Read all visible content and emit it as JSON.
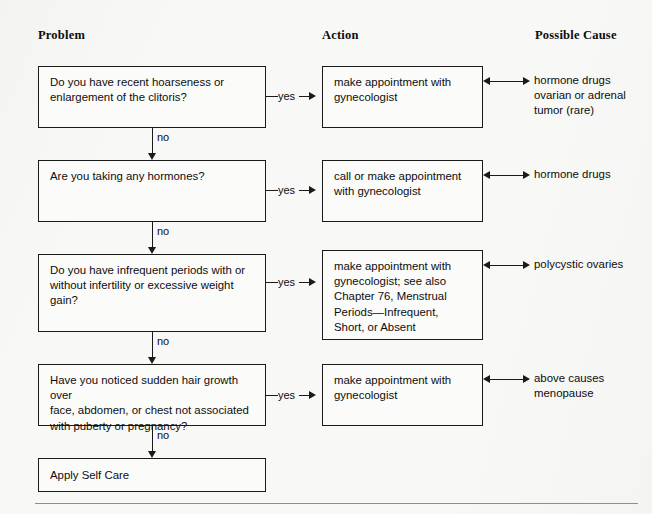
{
  "headers": {
    "problem": "Problem",
    "action": "Action",
    "cause": "Possible Cause"
  },
  "edge_labels": {
    "yes": "yes",
    "no": "no"
  },
  "rows": [
    {
      "problem": "Do you have recent hoarseness or\nenlargement of the clitoris?",
      "action": "make appointment with\ngynecologist",
      "cause": "hormone drugs\novarian or adrenal\ntumor (rare)",
      "yes": "yes",
      "no": "no"
    },
    {
      "problem": "Are you taking any hormones?",
      "action": "call or make appointment\nwith gynecologist",
      "cause": "hormone drugs",
      "yes": "yes",
      "no": "no"
    },
    {
      "problem": "Do you have infrequent periods with or\nwithout infertility or excessive weight\ngain?",
      "action": "make appointment with\ngynecologist; see also\nChapter 76, Menstrual\nPeriods—Infrequent,\nShort, or Absent",
      "cause": "polycystic ovaries",
      "yes": "yes",
      "no": "no"
    },
    {
      "problem": "Have you noticed sudden hair growth over\nface, abdomen, or chest not associated\nwith puberty or pregnancy?",
      "action": "make appointment with\ngynecologist",
      "cause": "above causes\nmenopause",
      "yes": "yes",
      "no": "no"
    }
  ],
  "terminal": {
    "label": "Apply Self Care"
  },
  "colors": {
    "ink": "#1a1a1a",
    "paper": "#f8f8f6",
    "rule": "#8e8e8e"
  }
}
